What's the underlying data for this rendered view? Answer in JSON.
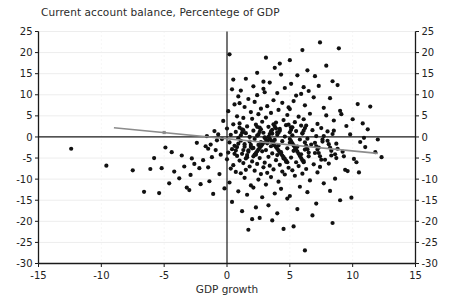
{
  "chart_data": {
    "type": "scatter",
    "title": "Current account balance, Percentege of GDP",
    "xlabel": "GDP growth",
    "ylabel": "",
    "xlim": [
      -15,
      15
    ],
    "ylim": [
      -30,
      25
    ],
    "xticks": [
      -15,
      -10,
      -5,
      0,
      5,
      10,
      15
    ],
    "yticks": [
      -30,
      -25,
      -20,
      -15,
      -10,
      -5,
      0,
      5,
      10,
      15,
      20,
      25
    ],
    "xtick_labels": [
      "-15",
      "-10",
      "-5",
      "0",
      "5",
      "10",
      "15"
    ],
    "ytick_labels_left": [
      "25",
      "20",
      "15",
      "10",
      "5",
      "0",
      "-5",
      "-10",
      "-15",
      "-20",
      "-25",
      "-30"
    ],
    "ytick_labels_right": [
      "25",
      "20",
      "15",
      "10",
      "5",
      "0",
      "-5",
      "-10",
      "-15",
      "-20",
      "-25",
      "-30"
    ],
    "grid": true,
    "grid_color": "#ededed",
    "legend": false,
    "point_color": "#111111",
    "point_radius": 2.1,
    "zero_line_y": 0,
    "zero_line_x": 0,
    "zero_line_color": "#1a1a1a",
    "trendline": {
      "color": "#8c8c8c",
      "x_start": -9.0,
      "y_start": 2.2,
      "x_end": 12.0,
      "y_end": -3.9,
      "marker_x": -5.0,
      "marker_y": 1.05
    },
    "points": [
      [
        7.4,
        22.4
      ],
      [
        8.9,
        21.0
      ],
      [
        6.0,
        20.6
      ],
      [
        0.2,
        19.6
      ],
      [
        4.3,
        14.8
      ],
      [
        5.6,
        14.6
      ],
      [
        7.0,
        14.4
      ],
      [
        2.9,
        13.1
      ],
      [
        3.4,
        12.9
      ],
      [
        5.1,
        12.6
      ],
      [
        8.8,
        12.3
      ],
      [
        2.1,
        12.0
      ],
      [
        4.6,
        11.6
      ],
      [
        0.4,
        11.3
      ],
      [
        1.1,
        11.0
      ],
      [
        6.5,
        10.9
      ],
      [
        3.0,
        10.6
      ],
      [
        4.0,
        10.4
      ],
      [
        5.9,
        10.2
      ],
      [
        2.4,
        9.9
      ],
      [
        0.9,
        9.6
      ],
      [
        6.9,
        9.4
      ],
      [
        8.2,
        9.2
      ],
      [
        1.7,
        9.0
      ],
      [
        3.7,
        8.7
      ],
      [
        5.3,
        8.5
      ],
      [
        2.2,
        8.3
      ],
      [
        4.4,
        8.1
      ],
      [
        10.4,
        7.8
      ],
      [
        11.4,
        7.2
      ],
      [
        0.6,
        7.7
      ],
      [
        6.2,
        7.5
      ],
      [
        3.2,
        7.3
      ],
      [
        1.4,
        7.1
      ],
      [
        7.7,
        6.9
      ],
      [
        2.7,
        6.7
      ],
      [
        5.0,
        6.6
      ],
      [
        4.1,
        6.4
      ],
      [
        9.0,
        6.2
      ],
      [
        0.1,
        6.1
      ],
      [
        1.9,
        5.9
      ],
      [
        3.5,
        5.7
      ],
      [
        6.6,
        5.5
      ],
      [
        2.5,
        5.4
      ],
      [
        4.8,
        5.2
      ],
      [
        7.9,
        5.1
      ],
      [
        0.8,
        4.9
      ],
      [
        5.7,
        4.8
      ],
      [
        3.1,
        4.6
      ],
      [
        1.3,
        4.5
      ],
      [
        2.0,
        4.3
      ],
      [
        6.1,
        4.2
      ],
      [
        4.5,
        4.0
      ],
      [
        8.5,
        3.9
      ],
      [
        -0.3,
        3.8
      ],
      [
        2.8,
        3.6
      ],
      [
        5.4,
        3.5
      ],
      [
        3.9,
        3.4
      ],
      [
        1.0,
        3.2
      ],
      [
        7.2,
        3.1
      ],
      [
        0.5,
        3.0
      ],
      [
        2.3,
        2.9
      ],
      [
        4.7,
        2.8
      ],
      [
        6.3,
        2.7
      ],
      [
        9.5,
        2.6
      ],
      [
        1.6,
        2.5
      ],
      [
        3.3,
        2.4
      ],
      [
        5.1,
        2.3
      ],
      [
        2.6,
        2.2
      ],
      [
        7.5,
        2.1
      ],
      [
        0.0,
        2.0
      ],
      [
        4.2,
        1.9
      ],
      [
        1.2,
        1.8
      ],
      [
        3.6,
        1.7
      ],
      [
        6.8,
        1.6
      ],
      [
        2.1,
        1.5
      ],
      [
        5.5,
        1.4
      ],
      [
        8.0,
        1.3
      ],
      [
        0.7,
        1.2
      ],
      [
        4.0,
        1.1
      ],
      [
        2.9,
        1.0
      ],
      [
        1.5,
        0.9
      ],
      [
        6.0,
        0.8
      ],
      [
        3.4,
        0.7
      ],
      [
        9.8,
        0.6
      ],
      [
        0.3,
        0.5
      ],
      [
        5.2,
        0.4
      ],
      [
        2.4,
        0.3
      ],
      [
        7.1,
        0.2
      ],
      [
        4.6,
        0.1
      ],
      [
        1.8,
        0.0
      ],
      [
        3.0,
        -0.1
      ],
      [
        10.9,
        -0.2
      ],
      [
        0.9,
        -0.3
      ],
      [
        6.4,
        -0.4
      ],
      [
        2.2,
        -0.5
      ],
      [
        5.8,
        -0.6
      ],
      [
        3.8,
        -0.7
      ],
      [
        -0.8,
        -0.8
      ],
      [
        1.1,
        -0.9
      ],
      [
        4.4,
        -1.0
      ],
      [
        7.6,
        -1.1
      ],
      [
        2.7,
        -1.2
      ],
      [
        0.2,
        -1.3
      ],
      [
        5.0,
        -1.4
      ],
      [
        3.2,
        -1.5
      ],
      [
        8.7,
        -1.6
      ],
      [
        1.4,
        -1.7
      ],
      [
        6.7,
        -1.8
      ],
      [
        2.5,
        -1.9
      ],
      [
        4.1,
        -2.0
      ],
      [
        0.6,
        -2.1
      ],
      [
        3.5,
        -2.2
      ],
      [
        5.6,
        -2.3
      ],
      [
        1.9,
        -2.4
      ],
      [
        7.3,
        -2.5
      ],
      [
        2.1,
        -2.6
      ],
      [
        4.8,
        -2.7
      ],
      [
        -1.5,
        -2.8
      ],
      [
        0.4,
        -2.9
      ],
      [
        6.2,
        -3.0
      ],
      [
        3.1,
        -3.1
      ],
      [
        1.7,
        -3.2
      ],
      [
        5.3,
        -3.3
      ],
      [
        2.8,
        -3.4
      ],
      [
        9.2,
        -3.5
      ],
      [
        4.3,
        -3.6
      ],
      [
        0.1,
        -3.7
      ],
      [
        7.0,
        -3.8
      ],
      [
        3.6,
        -3.9
      ],
      [
        1.2,
        -4.0
      ],
      [
        5.9,
        -4.1
      ],
      [
        2.3,
        -4.2
      ],
      [
        4.0,
        -4.3
      ],
      [
        8.3,
        -4.4
      ],
      [
        0.8,
        -4.5
      ],
      [
        6.5,
        -4.6
      ],
      [
        3.3,
        -4.7
      ],
      [
        1.6,
        -4.8
      ],
      [
        5.1,
        -4.9
      ],
      [
        2.6,
        -5.0
      ],
      [
        4.5,
        -5.1
      ],
      [
        10.1,
        -5.2
      ],
      [
        0.0,
        -5.3
      ],
      [
        7.8,
        -5.4
      ],
      [
        3.9,
        -5.5
      ],
      [
        1.0,
        -5.6
      ],
      [
        6.1,
        -5.7
      ],
      [
        2.0,
        -5.8
      ],
      [
        4.7,
        -5.9
      ],
      [
        5.5,
        -6.0
      ],
      [
        3.0,
        -6.1
      ],
      [
        1.3,
        -6.2
      ],
      [
        8.1,
        -6.3
      ],
      [
        2.4,
        -6.4
      ],
      [
        6.9,
        -6.5
      ],
      [
        4.2,
        -6.6
      ],
      [
        0.5,
        -6.7
      ],
      [
        3.4,
        -6.8
      ],
      [
        5.7,
        -6.9
      ],
      [
        1.8,
        -7.0
      ],
      [
        7.4,
        -7.1
      ],
      [
        2.9,
        -7.2
      ],
      [
        4.9,
        -7.3
      ],
      [
        -2.2,
        -7.4
      ],
      [
        0.3,
        -7.5
      ],
      [
        6.3,
        -7.6
      ],
      [
        3.7,
        -7.7
      ],
      [
        1.5,
        -7.8
      ],
      [
        5.2,
        -7.9
      ],
      [
        2.2,
        -8.0
      ],
      [
        9.6,
        -8.1
      ],
      [
        4.4,
        -8.2
      ],
      [
        0.7,
        -8.3
      ],
      [
        7.2,
        -8.4
      ],
      [
        3.2,
        -8.5
      ],
      [
        1.1,
        -8.6
      ],
      [
        6.0,
        -8.7
      ],
      [
        2.7,
        -8.8
      ],
      [
        4.6,
        -8.9
      ],
      [
        5.4,
        -9.2
      ],
      [
        3.5,
        -9.5
      ],
      [
        1.4,
        -9.7
      ],
      [
        8.6,
        -9.9
      ],
      [
        2.5,
        -10.1
      ],
      [
        6.6,
        -10.3
      ],
      [
        4.1,
        -10.6
      ],
      [
        0.2,
        -10.8
      ],
      [
        7.7,
        -11.0
      ],
      [
        3.1,
        -11.3
      ],
      [
        1.9,
        -11.5
      ],
      [
        5.8,
        -11.8
      ],
      [
        2.1,
        -12.0
      ],
      [
        4.3,
        -12.3
      ],
      [
        -3.0,
        -12.6
      ],
      [
        0.9,
        -12.9
      ],
      [
        6.4,
        -13.1
      ],
      [
        3.8,
        -13.4
      ],
      [
        1.6,
        -13.7
      ],
      [
        5.0,
        -14.0
      ],
      [
        2.8,
        -14.3
      ],
      [
        4.8,
        -14.6
      ],
      [
        9.0,
        -15.0
      ],
      [
        0.4,
        -15.4
      ],
      [
        7.1,
        -15.8
      ],
      [
        3.3,
        -16.2
      ],
      [
        2.3,
        -16.7
      ],
      [
        5.6,
        -17.1
      ],
      [
        1.2,
        -17.6
      ],
      [
        4.0,
        -18.1
      ],
      [
        6.8,
        -18.6
      ],
      [
        2.6,
        -19.2
      ],
      [
        3.6,
        -19.8
      ],
      [
        8.4,
        -20.4
      ],
      [
        5.3,
        -21.2
      ],
      [
        1.7,
        -22.0
      ],
      [
        6.2,
        -26.9
      ],
      [
        2.0,
        -19.5
      ],
      [
        4.5,
        -21.8
      ],
      [
        -4.9,
        -2.5
      ],
      [
        -5.2,
        -7.4
      ],
      [
        -6.1,
        -7.6
      ],
      [
        -4.2,
        -8.2
      ],
      [
        -3.4,
        -7.0
      ],
      [
        -2.6,
        -6.4
      ],
      [
        -1.9,
        -5.5
      ],
      [
        -1.2,
        -4.8
      ],
      [
        -0.5,
        -4.2
      ],
      [
        -2.9,
        -9.0
      ],
      [
        -3.8,
        -9.8
      ],
      [
        -1.4,
        -10.5
      ],
      [
        -2.1,
        -11.2
      ],
      [
        -0.9,
        -3.1
      ],
      [
        -1.7,
        -2.2
      ],
      [
        -2.4,
        -1.4
      ],
      [
        -12.4,
        -2.8
      ],
      [
        -9.6,
        -6.8
      ],
      [
        -7.5,
        -7.9
      ],
      [
        -6.6,
        -13.0
      ],
      [
        -5.4,
        -13.3
      ],
      [
        -4.6,
        -11.0
      ],
      [
        -3.2,
        -12.0
      ],
      [
        -1.1,
        -13.5
      ],
      [
        -0.2,
        -12.2
      ],
      [
        -0.6,
        -8.8
      ],
      [
        -1.5,
        -7.2
      ],
      [
        -2.8,
        -5.1
      ],
      [
        -3.6,
        -4.4
      ],
      [
        -4.4,
        -3.6
      ],
      [
        -5.8,
        -5.0
      ],
      [
        -0.4,
        -0.5
      ],
      [
        -0.7,
        0.6
      ],
      [
        -1.0,
        1.4
      ],
      [
        -1.3,
        -1.8
      ],
      [
        -1.6,
        0.2
      ],
      [
        10.0,
        4.2
      ],
      [
        10.6,
        -1.2
      ],
      [
        11.0,
        -2.4
      ],
      [
        11.8,
        -3.6
      ],
      [
        12.3,
        -4.8
      ],
      [
        10.3,
        -6.0
      ],
      [
        9.4,
        -7.8
      ],
      [
        8.2,
        -12.8
      ],
      [
        9.9,
        -14.4
      ],
      [
        11.2,
        1.8
      ],
      [
        10.8,
        3.2
      ],
      [
        12.0,
        -0.6
      ],
      [
        9.1,
        5.4
      ],
      [
        8.8,
        -2.8
      ],
      [
        9.3,
        -4.6
      ],
      [
        10.5,
        -8.4
      ],
      [
        5.0,
        18.2
      ],
      [
        3.8,
        16.4
      ],
      [
        6.4,
        15.8
      ],
      [
        2.4,
        15.2
      ],
      [
        7.9,
        16.9
      ],
      [
        4.2,
        17.4
      ],
      [
        1.5,
        13.8
      ],
      [
        8.4,
        13.2
      ],
      [
        0.5,
        13.6
      ],
      [
        6.1,
        11.8
      ],
      [
        2.9,
        11.4
      ],
      [
        5.5,
        9.8
      ],
      [
        3.1,
        18.8
      ],
      [
        7.3,
        12.1
      ],
      [
        4.9,
        7.0
      ],
      [
        1.0,
        8.0
      ],
      [
        3.3,
        0.0
      ],
      [
        3.4,
        -0.4
      ],
      [
        3.5,
        -0.8
      ],
      [
        3.6,
        -1.2
      ],
      [
        3.7,
        -1.6
      ],
      [
        3.8,
        -2.0
      ],
      [
        3.9,
        -2.4
      ],
      [
        4.0,
        -2.8
      ],
      [
        4.1,
        -3.2
      ],
      [
        4.2,
        -3.6
      ],
      [
        4.3,
        -4.0
      ],
      [
        4.4,
        -4.4
      ],
      [
        4.5,
        -4.8
      ],
      [
        4.6,
        -5.2
      ],
      [
        4.7,
        -5.6
      ],
      [
        4.8,
        -6.0
      ],
      [
        3.0,
        -0.2
      ],
      [
        3.1,
        -0.6
      ],
      [
        3.2,
        -1.0
      ],
      [
        2.9,
        -1.4
      ],
      [
        2.8,
        -1.8
      ],
      [
        2.7,
        -2.2
      ],
      [
        2.6,
        -2.6
      ],
      [
        2.5,
        -3.0
      ],
      [
        2.4,
        -3.4
      ],
      [
        2.3,
        -3.8
      ],
      [
        2.2,
        -4.2
      ],
      [
        2.1,
        -4.6
      ],
      [
        5.0,
        -0.5
      ],
      [
        5.1,
        -1.0
      ],
      [
        5.2,
        -1.5
      ],
      [
        5.3,
        -2.0
      ],
      [
        5.4,
        -2.5
      ],
      [
        5.5,
        -3.0
      ],
      [
        5.6,
        -3.5
      ],
      [
        5.7,
        -4.0
      ],
      [
        5.8,
        -4.5
      ],
      [
        5.9,
        -5.0
      ],
      [
        6.0,
        -5.5
      ],
      [
        6.1,
        -6.0
      ],
      [
        6.2,
        -1.3
      ],
      [
        6.3,
        -2.1
      ],
      [
        6.4,
        -2.9
      ],
      [
        6.5,
        -3.7
      ],
      [
        1.8,
        -1.1
      ],
      [
        1.9,
        -1.9
      ],
      [
        2.0,
        -2.7
      ],
      [
        1.7,
        -3.5
      ],
      [
        1.6,
        -4.3
      ],
      [
        1.5,
        -5.1
      ],
      [
        1.4,
        -2.3
      ],
      [
        1.3,
        -3.1
      ],
      [
        0.9,
        -1.6
      ],
      [
        0.8,
        -2.4
      ],
      [
        0.7,
        -3.2
      ],
      [
        0.6,
        -4.0
      ],
      [
        7.0,
        -1.4
      ],
      [
        7.1,
        -2.2
      ],
      [
        7.2,
        -3.0
      ],
      [
        7.3,
        -3.8
      ],
      [
        7.4,
        -4.6
      ],
      [
        7.5,
        -5.4
      ],
      [
        7.6,
        -0.6
      ],
      [
        7.7,
        0.2
      ],
      [
        4.0,
        0.5
      ],
      [
        4.1,
        1.0
      ],
      [
        4.2,
        1.5
      ],
      [
        3.9,
        2.0
      ],
      [
        3.8,
        2.5
      ],
      [
        3.7,
        3.0
      ],
      [
        3.6,
        0.8
      ],
      [
        3.5,
        1.3
      ],
      [
        2.5,
        0.6
      ],
      [
        2.6,
        1.2
      ],
      [
        2.7,
        1.8
      ],
      [
        2.4,
        2.4
      ],
      [
        5.0,
        1.1
      ],
      [
        5.1,
        1.7
      ],
      [
        5.2,
        2.3
      ],
      [
        4.9,
        2.9
      ],
      [
        6.0,
        0.9
      ],
      [
        6.1,
        1.5
      ],
      [
        6.2,
        2.1
      ],
      [
        5.9,
        2.7
      ],
      [
        1.1,
        0.4
      ],
      [
        1.2,
        1.0
      ],
      [
        1.3,
        1.6
      ],
      [
        1.0,
        2.2
      ],
      [
        8.0,
        -0.9
      ],
      [
        8.1,
        -1.7
      ],
      [
        8.2,
        -2.5
      ],
      [
        8.3,
        -3.3
      ],
      [
        8.4,
        0.7
      ],
      [
        8.5,
        1.5
      ],
      [
        8.6,
        -4.1
      ],
      [
        8.7,
        -5.0
      ]
    ]
  }
}
